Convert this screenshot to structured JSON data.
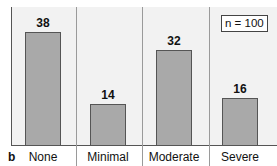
{
  "chart_data": {
    "type": "bar",
    "panel_label": "b",
    "categories": [
      "None",
      "Minimal",
      "Moderate",
      "Severe"
    ],
    "values": [
      38,
      14,
      32,
      16
    ],
    "annotation": "n = 100",
    "title": "",
    "xlabel": "",
    "ylabel": "",
    "ylim": [
      0,
      45
    ],
    "grid": false,
    "colors": {
      "bar": "#a9a9a9",
      "background": "#f2f2f2",
      "border": "#555555"
    }
  }
}
